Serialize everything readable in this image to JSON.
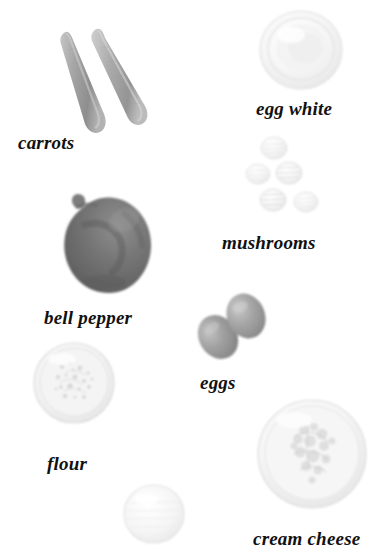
{
  "image": {
    "kind": "ingredient-photo-collage",
    "title": "",
    "background_color": "#ffffff",
    "width": 392,
    "height": 557,
    "rendering": "grayscale photographic cut-outs on white, each labelled in bold italic serif"
  },
  "labels": [
    {
      "id": "carrots",
      "text": "carrots",
      "x": 18,
      "y": 133,
      "font_size": 19
    },
    {
      "id": "egg_white",
      "text": "egg white",
      "x": 256,
      "y": 99,
      "font_size": 19
    },
    {
      "id": "mushrooms",
      "text": "mushrooms",
      "x": 222,
      "y": 233,
      "font_size": 19
    },
    {
      "id": "bell_pepper",
      "text": "bell pepper",
      "x": 44,
      "y": 308,
      "font_size": 19
    },
    {
      "id": "eggs",
      "text": "eggs",
      "x": 200,
      "y": 373,
      "font_size": 19
    },
    {
      "id": "flour",
      "text": "flour",
      "x": 47,
      "y": 454,
      "font_size": 19
    },
    {
      "id": "cream_cheese",
      "text": "cream cheese",
      "x": 253,
      "y": 529,
      "font_size": 19
    }
  ],
  "objects": [
    {
      "id": "carrots",
      "name": "carrots",
      "label_ref": "carrots",
      "count": 2,
      "box": {
        "x": 48,
        "y": 26,
        "w": 118,
        "h": 106
      },
      "fill": "#a9a9a9",
      "shade": "#8d8d8d",
      "highlight": "#c8c8c8"
    },
    {
      "id": "egg-white-bowl",
      "name": "egg white",
      "label_ref": "egg_white",
      "count": 1,
      "box": {
        "x": 258,
        "y": 10,
        "w": 84,
        "h": 80
      },
      "fill": "#f4f4f4",
      "shade": "#e3e3e3",
      "highlight": "#fdfdfd"
    },
    {
      "id": "mushrooms",
      "name": "mushrooms",
      "label_ref": "mushrooms",
      "count": 5,
      "box": {
        "x": 248,
        "y": 140,
        "w": 78,
        "h": 74
      },
      "fill": "#f0f0f0",
      "shade": "#dcdcdc",
      "highlight": "#fbfbfb"
    },
    {
      "id": "bell-pepper",
      "name": "bell pepper",
      "label_ref": "bell_pepper",
      "count": 1,
      "box": {
        "x": 55,
        "y": 190,
        "w": 105,
        "h": 106
      },
      "fill": "#6f6f6f",
      "shade": "#585858",
      "highlight": "#8c8c8c"
    },
    {
      "id": "eggs",
      "name": "eggs",
      "label_ref": "eggs",
      "count": 2,
      "box": {
        "x": 198,
        "y": 296,
        "w": 66,
        "h": 62
      },
      "fill": "#9a9a9a",
      "shade": "#7e7e7e",
      "highlight": "#bcbcbc"
    },
    {
      "id": "flour-bowl",
      "name": "flour",
      "label_ref": "flour",
      "count": 1,
      "box": {
        "x": 34,
        "y": 343,
        "w": 80,
        "h": 79
      },
      "fill": "#f1f1f1",
      "shade": "#d8d8d8",
      "highlight": "#fcfcfc"
    },
    {
      "id": "cream-cheese-bowl",
      "name": "cream cheese",
      "label_ref": "cream_cheese",
      "count": 1,
      "box": {
        "x": 258,
        "y": 400,
        "w": 110,
        "h": 110
      },
      "fill": "#f3f3f3",
      "shade": "#dadada",
      "highlight": "#fdfdfd"
    },
    {
      "id": "unlabelled-bowl",
      "name": "",
      "label_ref": "",
      "count": 1,
      "box": {
        "x": 124,
        "y": 485,
        "w": 60,
        "h": 58
      },
      "fill": "#f2f2f2",
      "shade": "#dedede",
      "highlight": "#fefefe"
    }
  ],
  "palette": {
    "background": "#ffffff",
    "text": "#111111",
    "dark_object": "#6f6f6f",
    "mid_object": "#9a9a9a",
    "light_object": "#f1f1f1"
  }
}
